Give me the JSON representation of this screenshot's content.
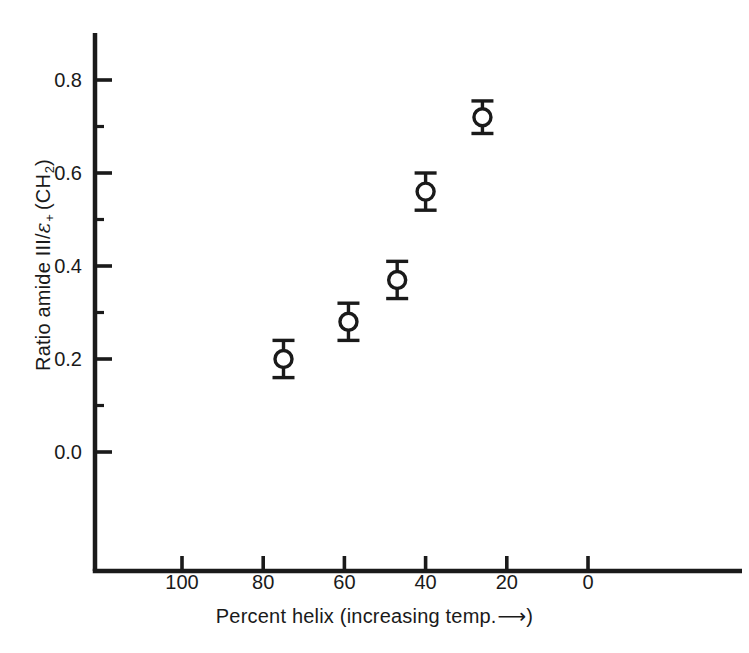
{
  "chart_data": {
    "type": "scatter",
    "title": "",
    "xlabel": "Percent helix (increasing temp. ⟶)",
    "xlabel_parts": {
      "pre": "Percent helix (increasing temp.",
      "arrow": "⟶",
      "post": ")"
    },
    "ylabel": "Ratio amide III/ε+ (CH2)",
    "ylabel_parts": {
      "pre": "Ratio amide III/",
      "epsilon": "ε",
      "epsilon_sub": "+",
      "mid": "(CH",
      "ch2_sub": "2",
      "post": ")"
    },
    "xlim": [
      110,
      -6
    ],
    "ylim": [
      -0.12,
      0.88
    ],
    "x_reversed": true,
    "grid": false,
    "legend": null,
    "marker": "open-circle",
    "error_bars": "vertical",
    "xticks": [
      100,
      80,
      60,
      40,
      20,
      0
    ],
    "xtick_labels": [
      "100",
      "80",
      "60",
      "40",
      "20",
      "0"
    ],
    "yticks": [
      0.0,
      0.2,
      0.4,
      0.6,
      0.8
    ],
    "ytick_labels": [
      "0.0",
      "0.2",
      "0.4",
      "0.6",
      "0.8"
    ],
    "y_minor_ticks": [
      0.1,
      0.3,
      0.5,
      0.7
    ],
    "x": [
      75,
      59,
      47,
      40,
      26
    ],
    "y": [
      0.2,
      0.28,
      0.37,
      0.56,
      0.72
    ],
    "yerr": [
      0.04,
      0.04,
      0.04,
      0.04,
      0.035
    ],
    "points": [
      {
        "x": 75,
        "y": 0.2,
        "yerr": 0.04
      },
      {
        "x": 59,
        "y": 0.28,
        "yerr": 0.04
      },
      {
        "x": 47,
        "y": 0.37,
        "yerr": 0.04
      },
      {
        "x": 40,
        "y": 0.56,
        "yerr": 0.04
      },
      {
        "x": 26,
        "y": 0.72,
        "yerr": 0.035
      }
    ],
    "colors": {
      "axis": "#1a1a1a",
      "marker_edge": "#1a1a1a",
      "marker_face": "#ffffff",
      "errorbar": "#1a1a1a",
      "background": "#ffffff"
    }
  }
}
